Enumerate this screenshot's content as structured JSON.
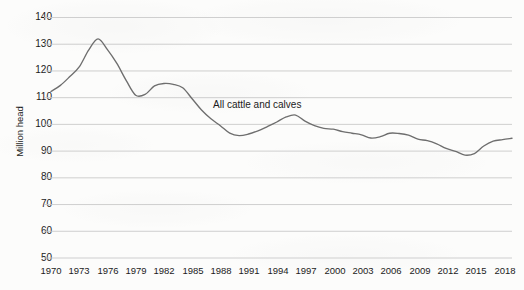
{
  "chart_data": {
    "type": "line",
    "title": "",
    "subtitle": "",
    "xlabel": "",
    "ylabel": "Million head",
    "xlim": [
      1970,
      2019
    ],
    "ylim": [
      50,
      140
    ],
    "grid": true,
    "legend_position": "inline-annotation",
    "annotations": [
      {
        "text": "All cattle and calves",
        "x": 1990,
        "y": 107
      }
    ],
    "y_ticks": [
      50,
      60,
      70,
      80,
      90,
      100,
      110,
      120,
      130,
      140
    ],
    "x_ticks": [
      1970,
      1973,
      1976,
      1979,
      1982,
      1985,
      1988,
      1991,
      1994,
      1997,
      2000,
      2003,
      2006,
      2009,
      2012,
      2015,
      2018
    ],
    "series": [
      {
        "name": "All cattle and calves",
        "color": "#6e6e6e",
        "x": [
          1970,
          1971,
          1972,
          1973,
          1974,
          1975,
          1976,
          1977,
          1978,
          1979,
          1980,
          1981,
          1982,
          1983,
          1984,
          1985,
          1986,
          1987,
          1988,
          1989,
          1990,
          1991,
          1992,
          1993,
          1994,
          1995,
          1996,
          1997,
          1998,
          1999,
          2000,
          2001,
          2002,
          2003,
          2004,
          2005,
          2006,
          2007,
          2008,
          2009,
          2010,
          2011,
          2012,
          2013,
          2014,
          2015,
          2016,
          2017,
          2018,
          2019
        ],
        "values": [
          112.3,
          114.6,
          117.9,
          121.5,
          127.8,
          132.0,
          128.0,
          122.8,
          116.4,
          110.9,
          111.2,
          114.4,
          115.3,
          115.0,
          113.7,
          109.6,
          105.4,
          102.1,
          99.5,
          96.7,
          95.8,
          96.4,
          97.6,
          99.2,
          100.9,
          102.8,
          103.5,
          101.2,
          99.5,
          98.5,
          98.2,
          97.3,
          96.7,
          96.1,
          94.9,
          95.4,
          96.7,
          96.6,
          96.0,
          94.5,
          93.9,
          92.7,
          91.0,
          89.9,
          88.5,
          89.1,
          91.9,
          93.7,
          94.3,
          94.8
        ]
      }
    ]
  },
  "axes": {
    "y_tick_labels": [
      "140",
      "130",
      "120",
      "110",
      "100",
      "90",
      "80",
      "70",
      "60",
      "50"
    ],
    "x_tick_labels": [
      "1970",
      "1973",
      "1976",
      "1979",
      "1982",
      "1985",
      "1988",
      "1991",
      "1994",
      "1997",
      "2000",
      "2003",
      "2006",
      "2009",
      "2012",
      "2015",
      "2018"
    ],
    "y_axis_title": "Million head"
  },
  "annotation": {
    "series_label": "All cattle and calves"
  },
  "colors": {
    "line": "#6e6e6e",
    "gridline": "#c9c9c9",
    "text": "#1b1b1b",
    "background": "#fcfcfb"
  }
}
